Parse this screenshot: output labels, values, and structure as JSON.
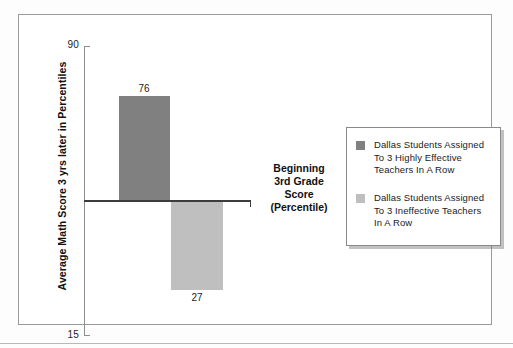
{
  "chart_data": {
    "type": "bar",
    "title": "",
    "subtitle": "",
    "xlabel": "",
    "ylabel": "Average Math Score 3 yrs later in Percentiles",
    "ylim": [
      15,
      90
    ],
    "yticks": [
      15,
      90
    ],
    "ytick_labels": [
      "15",
      "90"
    ],
    "grid": false,
    "baseline_value": 0,
    "legend_position": "right",
    "categories": [
      "Dallas Students Assigned To 3 Highly Effective Teachers In A Row",
      "Dallas Students Assigned To 3 Ineffective Teachers In A Row"
    ],
    "values": [
      76,
      27
    ],
    "data_labels": [
      "76",
      "27"
    ],
    "annotations": [
      {
        "name": "center-note",
        "lines": [
          "Beginning",
          "3rd Grade",
          "Score",
          "(Percentile)"
        ]
      }
    ],
    "series": [
      {
        "name": "Dallas Students Assigned To 3 Highly Effective Teachers In A Row",
        "value": 76,
        "color": "#808080",
        "direction": "up"
      },
      {
        "name": "Dallas Students Assigned To 3 Ineffective Teachers In A Row",
        "value": 27,
        "color": "#bfbfbf",
        "direction": "down"
      }
    ],
    "colors": {
      "bar_effective": "#808080",
      "bar_ineffective": "#bfbfbf",
      "axis": "#8e8e8e",
      "baseline": "#3c3c3c",
      "frame": "#9a9a9a",
      "text": "#1b1b1b"
    }
  },
  "axis": {
    "y_title": "Average Math Score 3 yrs later in Percentiles",
    "tick_top": "90",
    "tick_bottom": "15"
  },
  "bars": {
    "positive": {
      "label": "76",
      "value": 76
    },
    "negative": {
      "label": "27",
      "value": 27
    }
  },
  "center_note": {
    "line1": "Beginning",
    "line2": "3rd Grade",
    "line3": "Score",
    "line4": "(Percentile)"
  },
  "legend": {
    "items": [
      {
        "swatch_name": "legend-swatch-effective",
        "color": "#808080",
        "line1": "Dallas Students Assigned",
        "line2": "To 3 Highly Effective",
        "line3": "Teachers In A Row"
      },
      {
        "swatch_name": "legend-swatch-ineffective",
        "color": "#bfbfbf",
        "line1": "Dallas Students Assigned",
        "line2": "To 3 Ineffective Teachers",
        "line3": "In A Row"
      }
    ]
  }
}
